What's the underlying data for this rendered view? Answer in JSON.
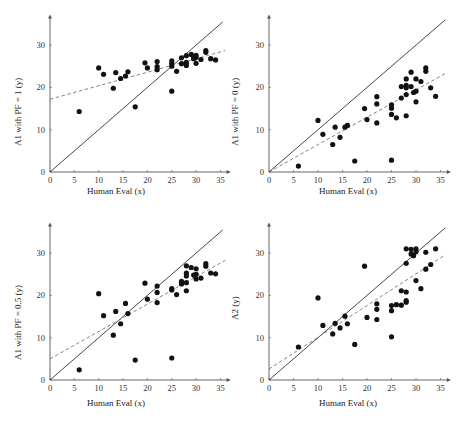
{
  "chart_data": [
    {
      "type": "scatter",
      "title": "",
      "xlabel": "Human Eval (x)",
      "ylabel": "A1 with PF = 1 (y)",
      "xlim": [
        0,
        36.5
      ],
      "ylim": [
        0,
        36.5
      ],
      "xticks": [
        0,
        5,
        10,
        15,
        20,
        25,
        30,
        35
      ],
      "yticks": [
        0,
        10,
        20,
        30
      ],
      "grid": false,
      "reference_line": {
        "style": "solid",
        "from": [
          0,
          0
        ],
        "to": [
          35.5,
          35.5
        ],
        "label": "y = x"
      },
      "fit_line": {
        "style": "dashed",
        "from": [
          0,
          17.2
        ],
        "to": [
          36,
          28.7
        ]
      },
      "points": [
        [
          6,
          14.3
        ],
        [
          10,
          24.6
        ],
        [
          11,
          23.1
        ],
        [
          13,
          19.8
        ],
        [
          13.5,
          23.5
        ],
        [
          14.5,
          22.1
        ],
        [
          15.5,
          22.7
        ],
        [
          16,
          23.7
        ],
        [
          17.5,
          15.4
        ],
        [
          19.5,
          25.8
        ],
        [
          20,
          24.6
        ],
        [
          22,
          26.1
        ],
        [
          22,
          24.9
        ],
        [
          22,
          24.2
        ],
        [
          25,
          26.3
        ],
        [
          25,
          25.6
        ],
        [
          25,
          25.0
        ],
        [
          25,
          19.1
        ],
        [
          26,
          23.8
        ],
        [
          27,
          27.0
        ],
        [
          27,
          25.6
        ],
        [
          28,
          27.5
        ],
        [
          28,
          25.9
        ],
        [
          28,
          25.2
        ],
        [
          29,
          27.8
        ],
        [
          29.5,
          27.2
        ],
        [
          29.5,
          26.8
        ],
        [
          30,
          27.6
        ],
        [
          30,
          27.1
        ],
        [
          30,
          25.7
        ],
        [
          31,
          26.6
        ],
        [
          32,
          28.7
        ],
        [
          32,
          28.3
        ],
        [
          33,
          26.8
        ],
        [
          34,
          26.5
        ]
      ]
    },
    {
      "type": "scatter",
      "title": "",
      "xlabel": "Human Eval (x)",
      "ylabel": "A1 with PF = 0 (y)",
      "xlim": [
        0,
        36.5
      ],
      "ylim": [
        0,
        36.5
      ],
      "xticks": [
        0,
        5,
        10,
        15,
        20,
        25,
        30,
        35
      ],
      "yticks": [
        0,
        10,
        20,
        30
      ],
      "grid": false,
      "reference_line": {
        "style": "solid",
        "from": [
          0,
          0
        ],
        "to": [
          36,
          36
        ],
        "label": "y = x"
      },
      "fit_line": {
        "style": "dashed",
        "from": [
          0,
          0
        ],
        "to": [
          36,
          23.3
        ]
      },
      "points": [
        [
          6,
          1.4
        ],
        [
          10,
          12.2
        ],
        [
          11,
          8.9
        ],
        [
          13,
          6.5
        ],
        [
          13.5,
          10.6
        ],
        [
          14.5,
          8.2
        ],
        [
          15.5,
          10.6
        ],
        [
          16,
          11.0
        ],
        [
          17.5,
          2.6
        ],
        [
          19.5,
          15.0
        ],
        [
          20,
          12.4
        ],
        [
          22,
          17.8
        ],
        [
          22,
          16.1
        ],
        [
          22,
          11.6
        ],
        [
          25,
          15.9
        ],
        [
          25,
          15.1
        ],
        [
          25,
          13.6
        ],
        [
          25,
          2.8
        ],
        [
          26,
          12.8
        ],
        [
          27,
          20.2
        ],
        [
          27,
          17.5
        ],
        [
          28,
          22.0
        ],
        [
          28,
          20.5
        ],
        [
          28,
          19.9
        ],
        [
          28,
          18.3
        ],
        [
          28,
          13.3
        ],
        [
          29,
          23.6
        ],
        [
          29,
          20.2
        ],
        [
          29.5,
          18.8
        ],
        [
          30,
          22.0
        ],
        [
          30,
          19.1
        ],
        [
          30,
          16.6
        ],
        [
          31,
          21.4
        ],
        [
          32,
          24.6
        ],
        [
          32,
          23.8
        ],
        [
          33,
          19.9
        ],
        [
          34,
          17.9
        ]
      ]
    },
    {
      "type": "scatter",
      "title": "",
      "xlabel": "Human Eval (x)",
      "ylabel": "A1 with PF = 0.5 (y)",
      "xlim": [
        0,
        36.5
      ],
      "ylim": [
        0,
        36.5
      ],
      "xticks": [
        0,
        5,
        10,
        15,
        20,
        25,
        30,
        35
      ],
      "yticks": [
        0,
        10,
        20,
        30
      ],
      "grid": false,
      "reference_line": {
        "style": "solid",
        "from": [
          0,
          0
        ],
        "to": [
          35.5,
          35.5
        ],
        "label": "y = x"
      },
      "fit_line": {
        "style": "dashed",
        "from": [
          0,
          5.0
        ],
        "to": [
          36,
          28.3
        ]
      },
      "points": [
        [
          6,
          2.4
        ],
        [
          10,
          20.4
        ],
        [
          11,
          15.2
        ],
        [
          13,
          10.6
        ],
        [
          13.5,
          16.2
        ],
        [
          14.5,
          13.3
        ],
        [
          15.5,
          18.1
        ],
        [
          16,
          15.7
        ],
        [
          17.5,
          4.7
        ],
        [
          19.5,
          22.9
        ],
        [
          20,
          19.1
        ],
        [
          22,
          22.2
        ],
        [
          22,
          20.7
        ],
        [
          22,
          18.3
        ],
        [
          25,
          21.6
        ],
        [
          25,
          21.3
        ],
        [
          25,
          5.2
        ],
        [
          26,
          20.2
        ],
        [
          27,
          23.3
        ],
        [
          27,
          22.7
        ],
        [
          28,
          27.0
        ],
        [
          28,
          25.3
        ],
        [
          28,
          24.6
        ],
        [
          28,
          23.0
        ],
        [
          28,
          21.1
        ],
        [
          29,
          26.6
        ],
        [
          29.5,
          24.8
        ],
        [
          30,
          26.3
        ],
        [
          30,
          25.0
        ],
        [
          30,
          23.9
        ],
        [
          31,
          24.1
        ],
        [
          32,
          27.5
        ],
        [
          32,
          26.9
        ],
        [
          33,
          25.3
        ],
        [
          34,
          25.1
        ]
      ]
    },
    {
      "type": "scatter",
      "title": "",
      "xlabel": "Human Eval (x)",
      "ylabel": "A2 (y)",
      "xlim": [
        0,
        36.5
      ],
      "ylim": [
        0,
        36.5
      ],
      "xticks": [
        0,
        5,
        10,
        15,
        20,
        25,
        30,
        35
      ],
      "yticks": [
        0,
        10,
        20,
        30
      ],
      "grid": false,
      "reference_line": {
        "style": "solid",
        "from": [
          0,
          0
        ],
        "to": [
          36,
          36
        ],
        "label": "y = x"
      },
      "fit_line": {
        "style": "dashed",
        "from": [
          0,
          2.6
        ],
        "to": [
          36,
          29.6
        ]
      },
      "points": [
        [
          6,
          7.8
        ],
        [
          10,
          19.4
        ],
        [
          11,
          12.9
        ],
        [
          13,
          10.9
        ],
        [
          13.5,
          13.4
        ],
        [
          14.5,
          12.3
        ],
        [
          15.5,
          15.1
        ],
        [
          16,
          13.3
        ],
        [
          17.5,
          8.4
        ],
        [
          19.5,
          26.9
        ],
        [
          20,
          14.8
        ],
        [
          22,
          18.0
        ],
        [
          22,
          16.7
        ],
        [
          22,
          14.3
        ],
        [
          25,
          17.6
        ],
        [
          25,
          16.4
        ],
        [
          25,
          10.2
        ],
        [
          26,
          17.8
        ],
        [
          27,
          21.1
        ],
        [
          27,
          17.7
        ],
        [
          28,
          31.0
        ],
        [
          28,
          27.6
        ],
        [
          28,
          20.8
        ],
        [
          28,
          18.8
        ],
        [
          28,
          18.4
        ],
        [
          29,
          30.9
        ],
        [
          29,
          29.8
        ],
        [
          29.5,
          29.4
        ],
        [
          30,
          31.0
        ],
        [
          30,
          30.3
        ],
        [
          30,
          23.5
        ],
        [
          31,
          21.6
        ],
        [
          32,
          30.2
        ],
        [
          32,
          26.2
        ],
        [
          33,
          27.3
        ],
        [
          34,
          31.0
        ]
      ]
    }
  ],
  "panels": [
    {
      "ylabel": "A1 with PF = 1 (y)",
      "xlabel": "Human Eval (x)"
    },
    {
      "ylabel": "A1 with PF = 0 (y)",
      "xlabel": "Human Eval (x)"
    },
    {
      "ylabel": "A1 with PF = 0.5 (y)",
      "xlabel": "Human Eval (x)"
    },
    {
      "ylabel": "A2 (y)",
      "xlabel": "Human Eval (x)"
    }
  ],
  "colors": {
    "axis": "#555555",
    "points": "#111111",
    "reference_line": "#333333",
    "fit_line": "#777777",
    "tick_text": "#333333"
  }
}
